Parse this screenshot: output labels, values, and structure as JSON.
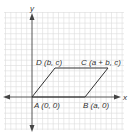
{
  "diagram": {
    "type": "coordinate-plane",
    "shape": "parallelogram",
    "axes": {
      "x_label": "x",
      "y_label": "y"
    },
    "vertices": {
      "A": {
        "name": "A",
        "coords": "(0, 0)",
        "label": "A (0, 0)"
      },
      "B": {
        "name": "B",
        "coords": "(a, 0)",
        "label": "B (a, 0)"
      },
      "C": {
        "name": "C",
        "coords": "(a + b, c)",
        "label": "C (a + b, c)"
      },
      "D": {
        "name": "D",
        "coords": "(b, c)",
        "label": "D (b, c)"
      }
    },
    "colors": {
      "grid": "#d9d9d9",
      "axis": "#444444",
      "shape": "#333333",
      "text": "#333333",
      "background": "#ffffff"
    }
  }
}
